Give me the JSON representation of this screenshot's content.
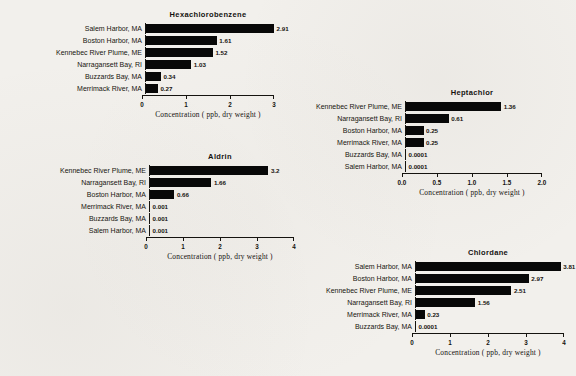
{
  "figure": {
    "background_color": "#f2f0ec",
    "bar_color": "#080808",
    "axis_color": "#15130f"
  },
  "chart_data": [
    {
      "id": "hexachlorobenzene",
      "type": "bar",
      "orientation": "horizontal",
      "title": "Hexachlorobenzene",
      "xlabel": "Concentration ( ppb, dry weight )",
      "ylabel": "",
      "xlim": [
        0,
        3
      ],
      "xticks": [
        0,
        1,
        2,
        3
      ],
      "xticklabels": [
        "0",
        "1",
        "2",
        "3"
      ],
      "grid": false,
      "legend": "none",
      "categories": [
        "Salem Harbor, MA",
        "Boston Harbor, MA",
        "Kennebec River Plume, ME",
        "Narragansett Bay, RI",
        "Buzzards Bay, MA",
        "Merrimack River, MA"
      ],
      "values": [
        2.91,
        1.61,
        1.52,
        1.03,
        0.34,
        0.27
      ],
      "value_labels": [
        "2.91",
        "1.61",
        "1.52",
        "1.03",
        "0.34",
        "0.27"
      ]
    },
    {
      "id": "heptachlor",
      "type": "bar",
      "orientation": "horizontal",
      "title": "Heptachlor",
      "xlabel": "Concentration ( ppb, dry weight )",
      "ylabel": "",
      "xlim": [
        0,
        2.0
      ],
      "xticks": [
        0.0,
        0.5,
        1.0,
        1.5,
        2.0
      ],
      "xticklabels": [
        "0.0",
        "0.5",
        "1.0",
        "1.5",
        "2.0"
      ],
      "grid": false,
      "legend": "none",
      "categories": [
        "Kennebec River Plume, ME",
        "Narragansett Bay, RI",
        "Boston Harbor, MA",
        "Merrimack River, MA",
        "Buzzards Bay, MA",
        "Salem Harbor, MA"
      ],
      "values": [
        1.36,
        0.61,
        0.25,
        0.25,
        0.0001,
        0.0001
      ],
      "value_labels": [
        "1.36",
        "0.61",
        "0.25",
        "0.25",
        "0.0001",
        "0.0001"
      ]
    },
    {
      "id": "aldrin",
      "type": "bar",
      "orientation": "horizontal",
      "title": "Aldrin",
      "xlabel": "Concentration ( ppb, dry weight )",
      "ylabel": "",
      "xlim": [
        0,
        4
      ],
      "xticks": [
        0,
        1,
        2,
        3,
        4
      ],
      "xticklabels": [
        "0",
        "1",
        "2",
        "3",
        "4"
      ],
      "grid": false,
      "legend": "none",
      "categories": [
        "Kennebec River Plume, ME",
        "Narragansett Bay, RI",
        "Boston Harbor, MA",
        "Merrimack River, MA",
        "Buzzards Bay, MA",
        "Salem Harbor, MA"
      ],
      "values": [
        3.2,
        1.66,
        0.66,
        0.001,
        0.001,
        0.001
      ],
      "value_labels": [
        "3.2",
        "1.66",
        "0.66",
        "0.001",
        "0.001",
        "0.001"
      ]
    },
    {
      "id": "chlordane",
      "type": "bar",
      "orientation": "horizontal",
      "title": "Chlordane",
      "xlabel": "Concentration ( ppb, dry weight )",
      "ylabel": "",
      "xlim": [
        0,
        4
      ],
      "xticks": [
        0,
        1,
        2,
        3,
        4
      ],
      "xticklabels": [
        "0",
        "1",
        "2",
        "3",
        "4"
      ],
      "grid": false,
      "legend": "none",
      "categories": [
        "Salem Harbor, MA",
        "Boston Harbor, MA",
        "Kennebec River Plume, ME",
        "Narragansett Bay, RI",
        "Merrimack River, MA",
        "Buzzards Bay, MA"
      ],
      "values": [
        3.81,
        2.97,
        2.51,
        1.56,
        0.23,
        0.0001
      ],
      "value_labels": [
        "3.81",
        "2.97",
        "2.51",
        "1.56",
        "0.23",
        "0.0001"
      ]
    }
  ]
}
